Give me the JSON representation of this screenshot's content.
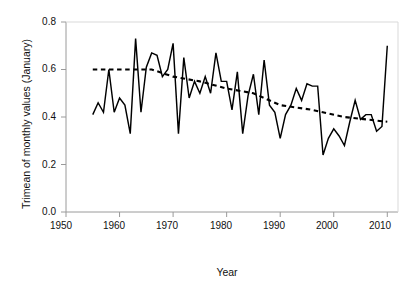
{
  "figure": {
    "background": "#ffffff",
    "line_color": "#000000",
    "trend_color": "#000000",
    "axis_color": "#9a9a9a"
  },
  "axes": {
    "xlabel": "Year",
    "ylabel": "Trimean of monthly values (January)",
    "xticks": [
      "1950",
      "1960",
      "1970",
      "1980",
      "1990",
      "2000",
      "2010"
    ],
    "yticks": [
      "0.0",
      "0.2",
      "0.4",
      "0.6",
      "0.8"
    ]
  },
  "chart_data": {
    "type": "line",
    "title": "",
    "xlabel": "Year",
    "ylabel": "Trimean of monthly values (January)",
    "xlim": [
      1950,
      2012
    ],
    "ylim": [
      0.0,
      0.8
    ],
    "xticks": [
      1950,
      1960,
      1970,
      1980,
      1990,
      2000,
      2010
    ],
    "yticks": [
      0.0,
      0.2,
      0.4,
      0.6,
      0.8
    ],
    "grid": false,
    "legend": "none",
    "series": [
      {
        "name": "Trimean of monthly values (January)",
        "style": "solid",
        "x": [
          1955,
          1956,
          1957,
          1958,
          1959,
          1960,
          1961,
          1962,
          1963,
          1964,
          1965,
          1966,
          1967,
          1968,
          1969,
          1970,
          1971,
          1972,
          1973,
          1974,
          1975,
          1976,
          1977,
          1978,
          1979,
          1980,
          1981,
          1982,
          1983,
          1984,
          1985,
          1986,
          1987,
          1988,
          1989,
          1990,
          1991,
          1992,
          1993,
          1994,
          1995,
          1996,
          1997,
          1998,
          1999,
          2000,
          2001,
          2002,
          2003,
          2004,
          2005,
          2006,
          2007,
          2008,
          2009,
          2010
        ],
        "values": [
          0.41,
          0.46,
          0.42,
          0.6,
          0.42,
          0.48,
          0.45,
          0.33,
          0.73,
          0.42,
          0.61,
          0.67,
          0.66,
          0.57,
          0.6,
          0.71,
          0.33,
          0.65,
          0.48,
          0.55,
          0.5,
          0.57,
          0.5,
          0.67,
          0.55,
          0.55,
          0.43,
          0.59,
          0.33,
          0.49,
          0.58,
          0.41,
          0.64,
          0.45,
          0.42,
          0.31,
          0.41,
          0.45,
          0.52,
          0.47,
          0.54,
          0.53,
          0.53,
          0.24,
          0.31,
          0.35,
          0.32,
          0.28,
          0.38,
          0.47,
          0.39,
          0.41,
          0.41,
          0.34,
          0.36,
          0.7
        ]
      },
      {
        "name": "Trend (dashed)",
        "style": "dashed",
        "x": [
          1955,
          1966,
          1970,
          1975,
          1980,
          1985,
          1990,
          1996,
          2002,
          2010
        ],
        "values": [
          0.6,
          0.6,
          0.57,
          0.55,
          0.52,
          0.5,
          0.45,
          0.43,
          0.4,
          0.38
        ]
      }
    ]
  }
}
